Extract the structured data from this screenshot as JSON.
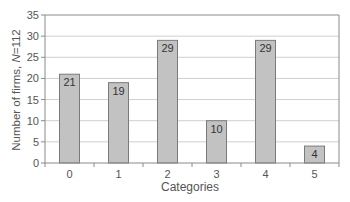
{
  "chart_data": {
    "type": "bar",
    "title": "",
    "xlabel": "Categories",
    "ylabel": "Number of firms, N=112",
    "ylabel_parts": {
      "prefix": "Number of firms, ",
      "italic": "N",
      "suffix": "=112"
    },
    "categories": [
      "0",
      "1",
      "2",
      "3",
      "4",
      "5"
    ],
    "values": [
      21,
      19,
      29,
      10,
      29,
      4
    ],
    "data_labels": [
      "21",
      "19",
      "29",
      "10",
      "29",
      "4"
    ],
    "ylim": [
      0,
      35
    ],
    "yticks": [
      0,
      5,
      10,
      15,
      20,
      25,
      30,
      35
    ],
    "grid": true,
    "legend": null,
    "colors": {
      "bar_fill": "#c2c2c2",
      "bar_border": "#7a7a7a",
      "grid": "#cfcfcf",
      "axis": "#8a8a8a",
      "text": "#555555"
    }
  }
}
